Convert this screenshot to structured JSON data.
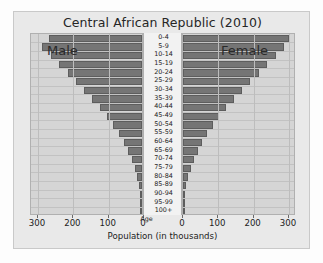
{
  "chart_data": {
    "type": "bar",
    "subtype": "population-pyramid",
    "title": "Central African Republic (2010)",
    "xlabel": "Population (in thousands)",
    "ylabel": "Age",
    "grid": true,
    "legend_position": "in-plot",
    "left_caption": "Male",
    "right_caption": "Female",
    "xlim_left": [
      300,
      0
    ],
    "xlim_right": [
      0,
      300
    ],
    "x_ticks_left": [
      "300",
      "200",
      "100",
      "0"
    ],
    "x_ticks_right": [
      "0",
      "100",
      "200",
      "300"
    ],
    "x_tick_values_left": [
      300,
      200,
      100,
      0
    ],
    "x_tick_values_right": [
      0,
      100,
      200,
      300
    ],
    "categories": [
      "100+",
      "95-99",
      "90-94",
      "85-89",
      "80-84",
      "75-79",
      "70-74",
      "65-69",
      "60-64",
      "55-59",
      "50-54",
      "45-49",
      "40-44",
      "35-39",
      "30-34",
      "25-29",
      "20-24",
      "15-19",
      "10-14",
      "5-9",
      "0-4"
    ],
    "series": [
      {
        "name": "Male",
        "side": "left",
        "values": [
          1,
          2,
          4,
          8,
          13,
          20,
          29,
          40,
          52,
          66,
          82,
          100,
          120,
          141,
          163,
          186,
          210,
          235,
          259,
          283,
          262
        ]
      },
      {
        "name": "Female",
        "side": "right",
        "values": [
          1,
          2,
          5,
          9,
          15,
          22,
          31,
          42,
          55,
          69,
          85,
          103,
          123,
          144,
          166,
          190,
          214,
          238,
          262,
          285,
          300
        ]
      }
    ],
    "bar_color": "#757575",
    "panel_background": "#d5d5d5",
    "figure_background": "#e9e9e9"
  }
}
